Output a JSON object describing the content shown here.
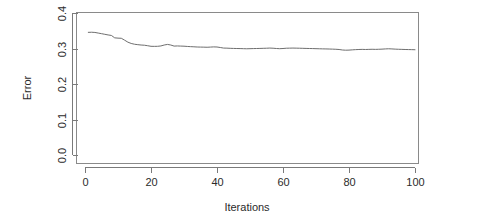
{
  "chart_data": {
    "type": "line",
    "title": "",
    "xlabel": "Iterations",
    "ylabel": "Error",
    "xlim": [
      0,
      101
    ],
    "ylim": [
      0.0,
      0.4
    ],
    "grid": false,
    "legend": null,
    "frame": "box",
    "line_color": "#6e6e6e",
    "x_ticks": [
      0,
      20,
      40,
      60,
      80,
      100
    ],
    "x_tick_labels": [
      "0",
      "20",
      "40",
      "60",
      "80",
      "100"
    ],
    "y_ticks": [
      0.0,
      0.1,
      0.2,
      0.3,
      0.4
    ],
    "y_tick_labels": [
      "0.0",
      "0.1",
      "0.2",
      "0.3",
      "0.4"
    ],
    "series": [
      {
        "name": "Error",
        "x": [
          1,
          2,
          3,
          4,
          5,
          6,
          7,
          8,
          9,
          10,
          11,
          12,
          13,
          14,
          15,
          16,
          17,
          18,
          19,
          20,
          21,
          22,
          23,
          24,
          25,
          26,
          27,
          28,
          29,
          30,
          31,
          32,
          33,
          34,
          35,
          36,
          37,
          38,
          39,
          40,
          41,
          42,
          43,
          44,
          45,
          46,
          47,
          48,
          49,
          50,
          51,
          52,
          53,
          54,
          55,
          56,
          57,
          58,
          59,
          60,
          61,
          62,
          63,
          64,
          65,
          66,
          67,
          68,
          69,
          70,
          71,
          72,
          73,
          74,
          75,
          76,
          77,
          78,
          79,
          80,
          81,
          82,
          83,
          84,
          85,
          86,
          87,
          88,
          89,
          90,
          91,
          92,
          93,
          94,
          95,
          96,
          97,
          98,
          99,
          100
        ],
        "values": [
          0.3455,
          0.3458,
          0.3452,
          0.3435,
          0.3418,
          0.34,
          0.3382,
          0.3368,
          0.33,
          0.3292,
          0.3288,
          0.3235,
          0.3178,
          0.3142,
          0.312,
          0.3108,
          0.3098,
          0.3092,
          0.3078,
          0.3062,
          0.306,
          0.3062,
          0.3072,
          0.3098,
          0.3115,
          0.3098,
          0.3068,
          0.3072,
          0.3068,
          0.3065,
          0.3058,
          0.3052,
          0.3048,
          0.3042,
          0.304,
          0.3038,
          0.3035,
          0.304,
          0.3045,
          0.3042,
          0.3028,
          0.3012,
          0.301,
          0.3005,
          0.3002,
          0.3,
          0.2998,
          0.2995,
          0.2992,
          0.2995,
          0.2998,
          0.3,
          0.3002,
          0.3005,
          0.3008,
          0.3012,
          0.3008,
          0.3,
          0.2995,
          0.3,
          0.3008,
          0.301,
          0.3012,
          0.301,
          0.3008,
          0.3005,
          0.3002,
          0.3,
          0.2998,
          0.2995,
          0.2992,
          0.299,
          0.2988,
          0.2985,
          0.2982,
          0.2978,
          0.2972,
          0.2958,
          0.2952,
          0.2955,
          0.2962,
          0.2968,
          0.2972,
          0.2975,
          0.2972,
          0.2975,
          0.2978,
          0.2975,
          0.2978,
          0.2982,
          0.2988,
          0.2992,
          0.2988,
          0.2982,
          0.2978,
          0.2975,
          0.2972,
          0.297,
          0.2968,
          0.2965
        ]
      }
    ]
  },
  "figure": {
    "background_color": "#ffffff",
    "axis_color": "#7a7a7a",
    "text_color": "#2b2b2b"
  }
}
